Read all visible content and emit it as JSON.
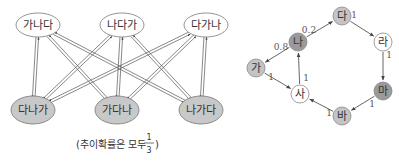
{
  "left_diagram": {
    "top_states": [
      {
        "label": "가나다",
        "x": 38,
        "y": 25
      },
      {
        "label": "나다가",
        "x": 122,
        "y": 25
      },
      {
        "label": "다가나",
        "x": 206,
        "y": 25
      }
    ],
    "bottom_states": [
      {
        "label": "다나가",
        "x": 33,
        "y": 110
      },
      {
        "label": "가다나",
        "x": 117,
        "y": 110
      },
      {
        "label": "나가다",
        "x": 201,
        "y": 110
      }
    ],
    "caption_prefix": "(추이확률은 모두",
    "caption_num": "1",
    "caption_den": "3",
    "caption_suffix": ")",
    "colors": {
      "top_fill": "#ffffff",
      "bottom_fill": "#c8c8c8",
      "stroke": "#777777"
    }
  },
  "right_diagram": {
    "nodes": [
      {
        "id": "ga",
        "label": "가",
        "x": 256,
        "y": 68,
        "fill": "#c4c4c4"
      },
      {
        "id": "na",
        "label": "나",
        "x": 298,
        "y": 42,
        "fill": "#9a9a9a"
      },
      {
        "id": "da",
        "label": "다",
        "x": 342,
        "y": 16,
        "fill": "#c4c4c4"
      },
      {
        "id": "ra",
        "label": "라",
        "x": 383,
        "y": 42,
        "fill": "#ffffff"
      },
      {
        "id": "ma",
        "label": "마",
        "x": 383,
        "y": 91,
        "fill": "#9a9a9a"
      },
      {
        "id": "ba",
        "label": "바",
        "x": 342,
        "y": 116,
        "fill": "#c4c4c4"
      },
      {
        "id": "sa",
        "label": "사",
        "x": 300,
        "y": 94,
        "fill": "#ffffff"
      }
    ],
    "edges": [
      {
        "from": "na",
        "to": "ga",
        "p": "0.8",
        "lx": 281,
        "ly": 47
      },
      {
        "from": "na",
        "to": "da",
        "p": "0.2",
        "lx": 309,
        "ly": 30
      },
      {
        "from": "da",
        "to": "ra",
        "p": "1",
        "lx": 354,
        "ly": 15
      },
      {
        "from": "ra",
        "to": "ma",
        "p": "1",
        "lx": 389,
        "ly": 55
      },
      {
        "from": "ma",
        "to": "ba",
        "p": "1",
        "lx": 372,
        "ly": 104
      },
      {
        "from": "ba",
        "to": "sa",
        "p": "1",
        "lx": 329,
        "ly": 113
      },
      {
        "from": "ga",
        "to": "sa",
        "p": "1",
        "lx": 271,
        "ly": 77
      },
      {
        "from": "sa",
        "to": "na",
        "p": "1",
        "lx": 306,
        "ly": 78
      }
    ]
  }
}
